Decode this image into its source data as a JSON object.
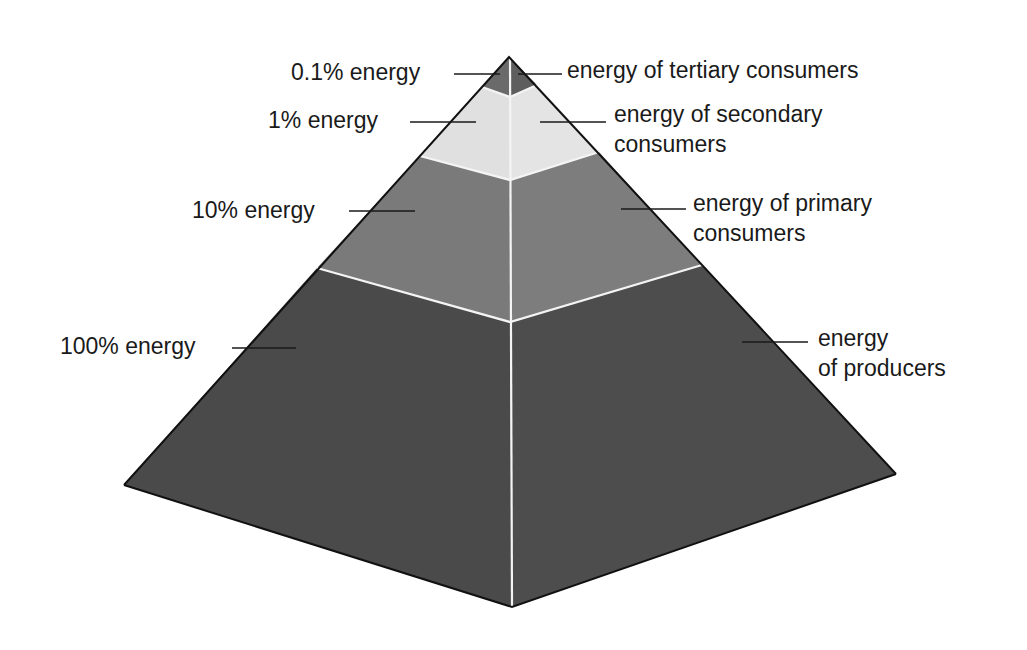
{
  "colors": {
    "producers": "#4a4a4a",
    "primary": "#7a7a7a",
    "secondary": "#e2e2e2",
    "tertiary": "#6a6a6a",
    "edge": "#111111",
    "seam": "#f0f0f0"
  },
  "tiers": [
    {
      "left_label": "0.1% energy",
      "right_label": "energy of tertiary consumers"
    },
    {
      "left_label": "1% energy",
      "right_label_line1": "energy of secondary",
      "right_label_line2": "consumers"
    },
    {
      "left_label": "10% energy",
      "right_label_line1": "energy of primary",
      "right_label_line2": "consumers"
    },
    {
      "left_label": "100% energy",
      "right_label_line1": "energy",
      "right_label_line2": "of producers"
    }
  ]
}
